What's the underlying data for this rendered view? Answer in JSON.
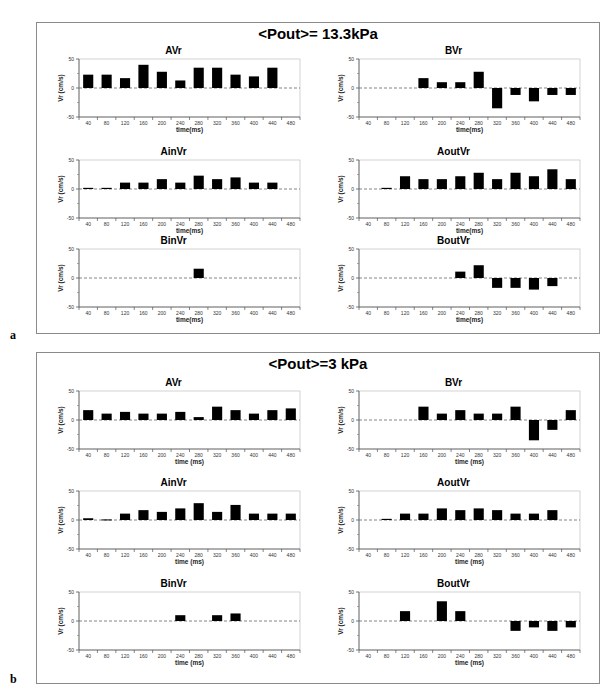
{
  "figure": {
    "panels": [
      {
        "letter": "a",
        "title": "<Pout>= 13.3kPa",
        "xlabel": "time(ms)"
      },
      {
        "letter": "b",
        "title": "<Pout>=3 kPa",
        "xlabel": "time (ms)"
      }
    ]
  },
  "chart_data": [
    {
      "panel": "a",
      "type": "bar",
      "title": "AVr",
      "xlabel": "time(ms)",
      "ylabel": "Vr (cm/s)",
      "ylim": [
        -50,
        50
      ],
      "yticks": [
        -50,
        0,
        50
      ],
      "categories": [
        40,
        80,
        120,
        160,
        200,
        240,
        280,
        320,
        360,
        400,
        440,
        480
      ],
      "values": [
        23,
        23,
        17,
        40,
        28,
        13,
        35,
        35,
        23,
        20,
        35,
        0
      ]
    },
    {
      "panel": "a",
      "type": "bar",
      "title": "BVr",
      "xlabel": "time(ms)",
      "ylabel": "Vr (cm/s)",
      "ylim": [
        -50,
        50
      ],
      "yticks": [
        -50,
        0,
        50
      ],
      "categories": [
        40,
        80,
        120,
        160,
        200,
        240,
        280,
        320,
        360,
        400,
        440,
        480
      ],
      "values": [
        0,
        0,
        0,
        17,
        10,
        10,
        28,
        -35,
        -12,
        -23,
        -12,
        -12
      ]
    },
    {
      "panel": "a",
      "type": "bar",
      "title": "AinVr",
      "xlabel": "time(ms)",
      "ylabel": "Vr (cm/s)",
      "ylim": [
        -50,
        50
      ],
      "yticks": [
        -50,
        0,
        50
      ],
      "categories": [
        40,
        80,
        120,
        160,
        200,
        240,
        280,
        320,
        360,
        400,
        440,
        480
      ],
      "values": [
        2,
        2,
        11,
        11,
        17,
        11,
        23,
        17,
        20,
        11,
        11,
        0
      ]
    },
    {
      "panel": "a",
      "type": "bar",
      "title": "AoutVr",
      "xlabel": "time(ms)",
      "ylabel": "Vr (cm/s)",
      "ylim": [
        -50,
        50
      ],
      "yticks": [
        -50,
        0,
        50
      ],
      "categories": [
        40,
        80,
        120,
        160,
        200,
        240,
        280,
        320,
        360,
        400,
        440,
        480
      ],
      "values": [
        0,
        2,
        22,
        17,
        17,
        22,
        28,
        17,
        28,
        22,
        34,
        17
      ]
    },
    {
      "panel": "a",
      "type": "bar",
      "title": "BinVr",
      "xlabel": "time(ms)",
      "ylabel": "Vr (cm/s)",
      "ylim": [
        -50,
        50
      ],
      "yticks": [
        -50,
        0,
        50
      ],
      "categories": [
        40,
        80,
        120,
        160,
        200,
        240,
        280,
        320,
        360,
        400,
        440,
        480
      ],
      "values": [
        0,
        0,
        0,
        0,
        0,
        0,
        16,
        0,
        0,
        0,
        0,
        0
      ]
    },
    {
      "panel": "a",
      "type": "bar",
      "title": "BoutVr",
      "xlabel": "time(ms)",
      "ylabel": "Vr (cm/s)",
      "ylim": [
        -50,
        50
      ],
      "yticks": [
        -50,
        0,
        50
      ],
      "categories": [
        40,
        80,
        120,
        160,
        200,
        240,
        280,
        320,
        360,
        400,
        440,
        480
      ],
      "values": [
        0,
        0,
        0,
        0,
        0,
        11,
        22,
        -17,
        -17,
        -20,
        -14,
        0
      ]
    },
    {
      "panel": "b",
      "type": "bar",
      "title": "AVr",
      "xlabel": "time (ms)",
      "ylabel": "Vr (cm/s)",
      "ylim": [
        -50,
        50
      ],
      "yticks": [
        -50,
        0,
        50
      ],
      "categories": [
        40,
        80,
        120,
        160,
        200,
        240,
        280,
        320,
        360,
        400,
        440,
        480
      ],
      "values": [
        17,
        11,
        14,
        11,
        11,
        14,
        5,
        23,
        17,
        11,
        17,
        20
      ]
    },
    {
      "panel": "b",
      "type": "bar",
      "title": "BVr",
      "xlabel": "time (ms)",
      "ylabel": "Vr (cm/s)",
      "ylim": [
        -50,
        50
      ],
      "yticks": [
        -50,
        0,
        50
      ],
      "categories": [
        40,
        80,
        120,
        160,
        200,
        240,
        280,
        320,
        360,
        400,
        440,
        480
      ],
      "values": [
        0,
        0,
        0,
        23,
        11,
        17,
        11,
        11,
        23,
        -35,
        -17,
        17
      ]
    },
    {
      "panel": "b",
      "type": "bar",
      "title": "AinVr",
      "xlabel": "time (ms)",
      "ylabel": "Vr (cm/s)",
      "ylim": [
        -50,
        50
      ],
      "yticks": [
        -50,
        0,
        50
      ],
      "categories": [
        40,
        80,
        120,
        160,
        200,
        240,
        280,
        320,
        360,
        400,
        440,
        480
      ],
      "values": [
        3,
        1,
        11,
        17,
        14,
        20,
        29,
        14,
        26,
        11,
        11,
        11
      ]
    },
    {
      "panel": "b",
      "type": "bar",
      "title": "AoutVr",
      "xlabel": "time (ms)",
      "ylabel": "Vr (cm/s)",
      "ylim": [
        -50,
        50
      ],
      "yticks": [
        -50,
        0,
        50
      ],
      "categories": [
        40,
        80,
        120,
        160,
        200,
        240,
        280,
        320,
        360,
        400,
        440,
        480
      ],
      "values": [
        0,
        2,
        11,
        11,
        20,
        17,
        20,
        17,
        11,
        11,
        17,
        0
      ]
    },
    {
      "panel": "b",
      "type": "bar",
      "title": "BinVr",
      "xlabel": "time (ms)",
      "ylabel": "Vr (cm/s)",
      "ylim": [
        -50,
        50
      ],
      "yticks": [
        -50,
        0,
        50
      ],
      "categories": [
        40,
        80,
        120,
        160,
        200,
        240,
        280,
        320,
        360,
        400,
        440,
        480
      ],
      "values": [
        0,
        0,
        0,
        0,
        0,
        10,
        0,
        10,
        13,
        0,
        0,
        0
      ]
    },
    {
      "panel": "b",
      "type": "bar",
      "title": "BoutVr",
      "xlabel": "time (ms)",
      "ylabel": "Vr (cm/s)",
      "ylim": [
        -50,
        50
      ],
      "yticks": [
        -50,
        0,
        50
      ],
      "categories": [
        40,
        80,
        120,
        160,
        200,
        240,
        280,
        320,
        360,
        400,
        440,
        480
      ],
      "values": [
        0,
        0,
        17,
        0,
        34,
        17,
        0,
        0,
        -17,
        -11,
        -17,
        -11
      ]
    }
  ]
}
